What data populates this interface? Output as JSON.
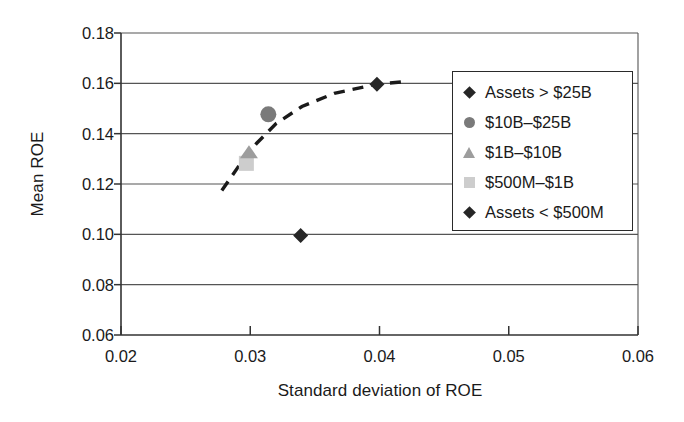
{
  "chart_data": {
    "type": "scatter",
    "title": "",
    "xlabel": "Standard deviation of ROE",
    "ylabel": "Mean ROE",
    "xlim": [
      0.02,
      0.06
    ],
    "ylim": [
      0.06,
      0.18
    ],
    "xticks": [
      "0.02",
      "0.03",
      "0.04",
      "0.05",
      "0.06"
    ],
    "xtick_values": [
      0.02,
      0.03,
      0.04,
      0.05,
      0.06
    ],
    "yticks": [
      "0.06",
      "0.08",
      "0.10",
      "0.12",
      "0.14",
      "0.16",
      "0.18"
    ],
    "ytick_values": [
      0.06,
      0.08,
      0.1,
      0.12,
      0.14,
      0.16,
      0.18
    ],
    "grid": "horizontal",
    "legend_position": "right",
    "points": [
      {
        "label": "Assets > $25B",
        "x": 0.0398,
        "y": 0.1596,
        "marker": "diamond",
        "color": "#262626"
      },
      {
        "label": "$10B–$25B",
        "x": 0.0314,
        "y": 0.1477,
        "marker": "circle",
        "color": "#7a7a7a"
      },
      {
        "label": "$1B–$10B",
        "x": 0.0299,
        "y": 0.1326,
        "marker": "triangle",
        "color": "#9d9d9d"
      },
      {
        "label": "$500M–$1B",
        "x": 0.0297,
        "y": 0.1282,
        "marker": "square",
        "color": "#cdcdcd"
      },
      {
        "label": "Assets < $500M",
        "x": 0.0339,
        "y": 0.0995,
        "marker": "diamond",
        "color": "#262626"
      }
    ],
    "trend_line": {
      "style": "dashed",
      "color": "#1a1a1a",
      "x": [
        0.0278,
        0.0292,
        0.0305,
        0.032,
        0.034,
        0.0365,
        0.0398,
        0.0418
      ],
      "y": [
        0.1174,
        0.1278,
        0.1362,
        0.144,
        0.1508,
        0.156,
        0.1597,
        0.1606
      ]
    },
    "legend": [
      {
        "label": "Assets > $25B",
        "marker": "diamond",
        "color": "#262626"
      },
      {
        "label": "$10B–$25B",
        "marker": "circle",
        "color": "#7a7a7a"
      },
      {
        "label": "$1B–$10B",
        "marker": "triangle",
        "color": "#9d9d9d"
      },
      {
        "label": "$500M–$1B",
        "marker": "square",
        "color": "#cdcdcd"
      },
      {
        "label": "Assets < $500M",
        "marker": "diamond",
        "color": "#262626"
      }
    ]
  }
}
